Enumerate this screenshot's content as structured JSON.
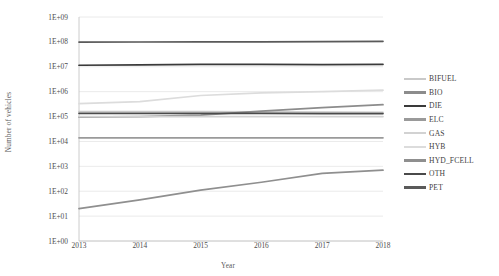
{
  "chart_data": {
    "type": "line",
    "title": "",
    "xlabel": "Year",
    "ylabel": "Number of vehicles",
    "x": [
      2013,
      2014,
      2015,
      2016,
      2017,
      2018
    ],
    "xtick_labels": [
      "2013",
      "2014",
      "2015",
      "2016",
      "2017",
      "2018"
    ],
    "ytick_labels": [
      "1E+09",
      "1E+08",
      "1E+07",
      "1E+06",
      "1E+05",
      "1E+04",
      "1E+03",
      "1E+02",
      "1E+01",
      "1E+00"
    ],
    "ytick_values": [
      1000000000,
      100000000,
      10000000,
      1000000,
      100000,
      10000,
      1000,
      100,
      10,
      1
    ],
    "yscale": "log",
    "ylim": [
      1,
      1000000000
    ],
    "grid": true,
    "legend_position": "right",
    "series": [
      {
        "name": "BIFUEL",
        "color": "#c9c9c9",
        "values": [
          160000,
          160000,
          158000,
          155000,
          150000,
          148000
        ]
      },
      {
        "name": "BIO",
        "color": "#8c8c8c",
        "values": [
          95000,
          100000,
          115000,
          165000,
          230000,
          300000
        ]
      },
      {
        "name": "DIE",
        "color": "#3a3a3a",
        "values": [
          11500000,
          12000000,
          12400000,
          12600000,
          12200000,
          12600000
        ]
      },
      {
        "name": "ELC",
        "color": "#9a9a9a",
        "values": [
          14000,
          14000,
          14000,
          14000,
          14000,
          14000
        ]
      },
      {
        "name": "GAS",
        "color": "#d2d2d2",
        "values": [
          100000,
          100000,
          100000,
          100000,
          100000,
          100000
        ]
      },
      {
        "name": "HYB",
        "color": "#dcdcdc",
        "values": [
          330000,
          400000,
          700000,
          900000,
          1000000,
          1150000
        ]
      },
      {
        "name": "HYD_FCELL",
        "color": "#8f8f8f",
        "values": [
          20,
          45,
          110,
          230,
          520,
          700
        ]
      },
      {
        "name": "OTH",
        "color": "#4a4a4a",
        "values": [
          135000,
          135000,
          135000,
          133000,
          132000,
          132000
        ]
      },
      {
        "name": "PET",
        "color": "#5a5a5a",
        "values": [
          98000000,
          99000000,
          100000000,
          101000000,
          103000000,
          105000000
        ]
      }
    ]
  },
  "legend": {
    "items": [
      {
        "label": "BIFUEL"
      },
      {
        "label": "BIO"
      },
      {
        "label": "DIE"
      },
      {
        "label": "ELC"
      },
      {
        "label": "GAS"
      },
      {
        "label": "HYB"
      },
      {
        "label": "HYD_FCELL"
      },
      {
        "label": "OTH"
      },
      {
        "label": "PET"
      }
    ]
  },
  "colors": {
    "background": "#ffffff",
    "grid": "#e4e4e4",
    "text": "#4d4d4d"
  }
}
